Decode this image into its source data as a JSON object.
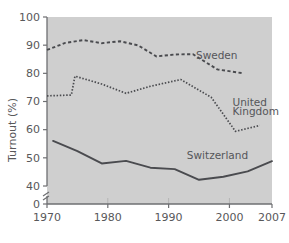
{
  "chart_data": {
    "type": "line",
    "title": "",
    "subtitle": "",
    "xlabel": "",
    "ylabel": "Turnout (%)",
    "xlim": [
      1970,
      2007
    ],
    "ylim": [
      40,
      100
    ],
    "y_axis_break": true,
    "y_break_from": 0,
    "y_break_to": 40,
    "grid": false,
    "legend_position": "inline-annotations",
    "x_ticks": [
      "1970",
      "1980",
      "1990",
      "2000",
      "2007"
    ],
    "x_tick_values": [
      1970,
      1980,
      1990,
      2000,
      2007
    ],
    "y_ticks": [
      "0",
      "40",
      "50",
      "60",
      "70",
      "80",
      "90",
      "100"
    ],
    "y_tick_values": [
      0,
      40,
      50,
      60,
      70,
      80,
      90,
      100
    ],
    "series": [
      {
        "name": "Sweden",
        "style": "dashed",
        "color": "#4a4b4f",
        "x": [
          1970,
          1973,
          1976,
          1979,
          1982,
          1985,
          1988,
          1991,
          1994,
          1998,
          2002
        ],
        "values": [
          88.3,
          90.8,
          91.8,
          90.7,
          91.4,
          89.9,
          86.0,
          86.7,
          86.8,
          81.4,
          80.1
        ]
      },
      {
        "name": "United Kingdom",
        "style": "dotted",
        "color": "#4a4b4f",
        "x": [
          1970,
          1974,
          1974.6,
          1979,
          1983,
          1987,
          1992,
          1997,
          2001,
          2005
        ],
        "values": [
          72.0,
          72.3,
          79.0,
          76.2,
          72.9,
          75.4,
          77.8,
          71.5,
          59.4,
          61.5
        ]
      },
      {
        "name": "Switzerland",
        "style": "solid",
        "color": "#4a4b4f",
        "x": [
          1971,
          1975,
          1979,
          1983,
          1987,
          1991,
          1995,
          1999,
          2003,
          2007
        ],
        "values": [
          56.0,
          52.4,
          48.0,
          48.9,
          46.5,
          46.0,
          42.2,
          43.3,
          45.2,
          48.8
        ]
      }
    ],
    "annotations": [
      {
        "text": "Sweden",
        "x": 1994.5,
        "y": 85.0
      },
      {
        "text": "United",
        "x": 2000.5,
        "y": 68.5
      },
      {
        "text": "Kingdom",
        "x": 2000.5,
        "y": 65.3
      },
      {
        "text": "Switzerland",
        "x": 1993.0,
        "y": 49.5
      }
    ]
  }
}
